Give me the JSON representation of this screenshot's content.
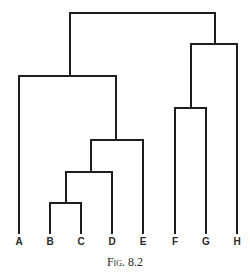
{
  "figure": {
    "caption": "Fig. 8.2",
    "line_color": "#1e1e1e",
    "leaves": [
      {
        "label": "A",
        "x": 19
      },
      {
        "label": "B",
        "x": 50
      },
      {
        "label": "C",
        "x": 81
      },
      {
        "label": "D",
        "x": 112
      },
      {
        "label": "E",
        "x": 143
      },
      {
        "label": "F",
        "x": 175
      },
      {
        "label": "G",
        "x": 206
      },
      {
        "label": "H",
        "x": 237
      }
    ],
    "merges": [
      {
        "members": [
          "B",
          "C"
        ],
        "y": 203
      },
      {
        "members": [
          "B",
          "C",
          "D"
        ],
        "y": 172
      },
      {
        "members": [
          "B",
          "C",
          "D",
          "E"
        ],
        "y": 140
      },
      {
        "members": [
          "F",
          "G"
        ],
        "y": 108
      },
      {
        "members": [
          "A",
          "B",
          "C",
          "D",
          "E"
        ],
        "y": 76
      },
      {
        "members": [
          "F",
          "G",
          "H"
        ],
        "y": 44
      },
      {
        "members": [
          "A",
          "B",
          "C",
          "D",
          "E",
          "F",
          "G",
          "H"
        ],
        "y": 13
      }
    ]
  }
}
